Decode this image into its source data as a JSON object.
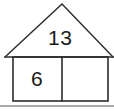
{
  "figure": {
    "stroke_color": "#2b2b2b",
    "text_color": "#1a1a1a",
    "background_color": "#ffffff",
    "roof": {
      "label": "13",
      "apex": {
        "x": 62,
        "y": 4
      },
      "left_eave": {
        "x": 5,
        "y": 57
      },
      "right_eave": {
        "x": 113,
        "y": 57
      }
    },
    "body": {
      "left": 13,
      "top": 57,
      "right": 108,
      "bottom": 101,
      "divider_x": 62,
      "left_cell": {
        "label": "6"
      },
      "right_cell": {
        "label": ""
      }
    },
    "baseline_rule": {
      "y": 106,
      "x_start": 0,
      "x_end": 114
    }
  }
}
